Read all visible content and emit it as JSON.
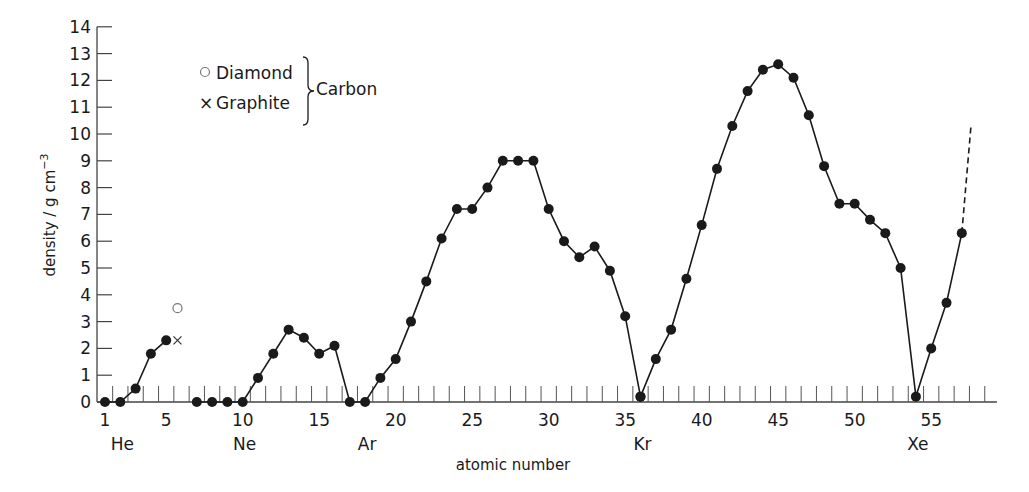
{
  "chart_data": {
    "type": "line",
    "title": "",
    "xlabel": "atomic number",
    "ylabel": "density / g cm⁻³",
    "ylabel_main": "density / g cm",
    "ylabel_sup": "−3",
    "xlim": [
      1,
      58
    ],
    "ylim": [
      0,
      14
    ],
    "y_ticks": [
      0,
      1,
      2,
      3,
      4,
      5,
      6,
      7,
      8,
      9,
      10,
      11,
      12,
      13,
      14
    ],
    "x_ticks": [
      1,
      5,
      10,
      15,
      20,
      25,
      30,
      35,
      40,
      45,
      50,
      55
    ],
    "x_tick_labels": [
      "1",
      "5",
      "10",
      "15",
      "20",
      "25",
      "30",
      "35",
      "40",
      "45",
      "50",
      "55"
    ],
    "element_labels": [
      {
        "label": "He",
        "x": 2
      },
      {
        "label": "Ne",
        "x": 10
      },
      {
        "label": "Ar",
        "x": 18
      },
      {
        "label": "Kr",
        "x": 36
      },
      {
        "label": "Xe",
        "x": 54
      }
    ],
    "series": [
      {
        "name": "elements 1-5",
        "points": [
          [
            1,
            0
          ],
          [
            2,
            0
          ],
          [
            3,
            0.5
          ],
          [
            4,
            1.8
          ],
          [
            5,
            2.3
          ]
        ]
      },
      {
        "name": "elements 7-36",
        "points": [
          [
            7,
            0
          ],
          [
            8,
            0
          ],
          [
            9,
            0
          ],
          [
            10,
            0
          ],
          [
            11,
            0.9
          ],
          [
            12,
            1.8
          ],
          [
            13,
            2.7
          ],
          [
            14,
            2.4
          ],
          [
            15,
            1.8
          ],
          [
            16,
            2.1
          ],
          [
            17,
            0
          ],
          [
            18,
            0
          ],
          [
            19,
            0.9
          ],
          [
            20,
            1.6
          ],
          [
            21,
            3.0
          ],
          [
            22,
            4.5
          ],
          [
            23,
            6.1
          ],
          [
            24,
            7.2
          ],
          [
            25,
            7.2
          ],
          [
            26,
            8.0
          ],
          [
            27,
            9.0
          ],
          [
            28,
            9.0
          ],
          [
            29,
            9.0
          ],
          [
            30,
            7.2
          ],
          [
            31,
            6.0
          ],
          [
            32,
            5.4
          ],
          [
            33,
            5.8
          ],
          [
            34,
            4.9
          ],
          [
            35,
            3.2
          ],
          [
            36,
            0.2
          ]
        ]
      },
      {
        "name": "elements 36-57",
        "points": [
          [
            36,
            0.2
          ],
          [
            37,
            1.6
          ],
          [
            38,
            2.7
          ],
          [
            39,
            4.6
          ],
          [
            40,
            6.6
          ],
          [
            41,
            8.7
          ],
          [
            42,
            10.3
          ],
          [
            43,
            11.6
          ],
          [
            44,
            12.4
          ],
          [
            45,
            12.6
          ],
          [
            46,
            12.1
          ],
          [
            47,
            10.7
          ],
          [
            48,
            8.8
          ],
          [
            49,
            7.4
          ],
          [
            50,
            7.4
          ],
          [
            51,
            6.8
          ],
          [
            52,
            6.3
          ],
          [
            53,
            5.0
          ],
          [
            54,
            0.2
          ],
          [
            55,
            2.0
          ],
          [
            56,
            3.7
          ],
          [
            57,
            6.3
          ]
        ]
      }
    ],
    "dashed_extension": {
      "from": [
        57,
        6.3
      ],
      "to": [
        57.6,
        10.3
      ]
    },
    "carbon": [
      {
        "name": "Diamond",
        "marker": "circle",
        "x": 6,
        "y": 3.5
      },
      {
        "name": "Graphite",
        "marker": "cross",
        "x": 6,
        "y": 2.3
      }
    ],
    "legend": {
      "items": [
        {
          "marker": "○",
          "label": "Diamond"
        },
        {
          "marker": "×",
          "label": "Graphite"
        }
      ],
      "group_label": "Carbon"
    },
    "grid": false
  }
}
